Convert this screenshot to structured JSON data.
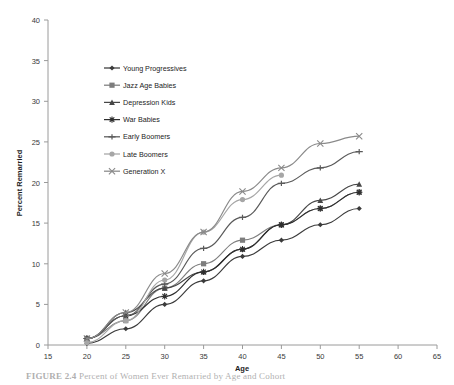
{
  "chart_data": {
    "type": "line",
    "title": "",
    "xlabel": "Age",
    "ylabel": "Percent Remarried",
    "x": [
      20,
      25,
      30,
      35,
      40,
      45,
      50,
      55
    ],
    "xlim": [
      15,
      65
    ],
    "ylim": [
      0,
      40
    ],
    "xticks": [
      15,
      20,
      25,
      30,
      35,
      40,
      45,
      50,
      55,
      60,
      65
    ],
    "yticks": [
      0,
      5,
      10,
      15,
      20,
      25,
      30,
      35,
      40
    ],
    "grid": false,
    "legend_position": "upper-left-inside",
    "series": [
      {
        "name": "Young Progressives",
        "marker": "diamond",
        "color": "#3b3b3b",
        "x": [
          20,
          25,
          30,
          35,
          40,
          45,
          50,
          55
        ],
        "values": [
          0.2,
          2.0,
          5.0,
          7.9,
          10.9,
          12.9,
          14.8,
          16.8
        ]
      },
      {
        "name": "Jazz Age Babies",
        "marker": "square",
        "color": "#7d7d7d",
        "x": [
          20,
          25,
          30,
          35,
          40,
          45,
          50,
          55
        ],
        "values": [
          0.8,
          3.0,
          7.0,
          10.0,
          12.9,
          14.8,
          16.8,
          18.8
        ]
      },
      {
        "name": "Depression Kids",
        "marker": "triangle",
        "color": "#474747",
        "x": [
          20,
          25,
          30,
          35,
          40,
          45,
          50,
          55
        ],
        "values": [
          0.8,
          4.0,
          7.0,
          9.0,
          11.8,
          14.8,
          17.8,
          19.8
        ]
      },
      {
        "name": "War Babies",
        "marker": "cross-plus",
        "color": "#2e2e2e",
        "x": [
          20,
          25,
          30,
          35,
          40,
          45,
          50,
          55
        ],
        "values": [
          0.8,
          3.6,
          6.0,
          9.0,
          11.8,
          14.8,
          16.8,
          18.8
        ]
      },
      {
        "name": "Early Boomers",
        "marker": "dash",
        "color": "#5a5a5a",
        "x": [
          20,
          25,
          30,
          35,
          40,
          45,
          50,
          55
        ],
        "values": [
          0.8,
          3.6,
          7.5,
          11.9,
          15.7,
          19.9,
          21.8,
          23.8
        ]
      },
      {
        "name": "Late Boomers",
        "marker": "circle",
        "color": "#a6a6a6",
        "x": [
          20,
          25,
          30,
          35,
          40,
          45
        ],
        "values": [
          0.3,
          3.0,
          8.0,
          13.9,
          17.9,
          20.9
        ]
      },
      {
        "name": "Generation X",
        "marker": "x-cross",
        "color": "#8a8a8a",
        "x": [
          20,
          25,
          30,
          35,
          40,
          45,
          50,
          55
        ],
        "values": [
          0.8,
          4.0,
          8.8,
          13.9,
          18.9,
          21.8,
          24.8,
          25.7
        ]
      }
    ]
  },
  "legend": {
    "entries": [
      {
        "label": "Young Progressives"
      },
      {
        "label": "Jazz Age Babies"
      },
      {
        "label": "Depression Kids"
      },
      {
        "label": "War Babies"
      },
      {
        "label": "Early Boomers"
      },
      {
        "label": "Late Boomers"
      },
      {
        "label": "Generation X"
      }
    ]
  },
  "axes": {
    "x_title": "Age",
    "y_title": "Percent Remarried",
    "x_tick_labels": [
      "15",
      "20",
      "25",
      "30",
      "35",
      "40",
      "45",
      "50",
      "55",
      "60",
      "65"
    ],
    "y_tick_labels": [
      "0",
      "5",
      "10",
      "15",
      "20",
      "25",
      "30",
      "35",
      "40"
    ]
  },
  "caption": {
    "label": "FIGURE 2.4",
    "text": "Percent of Women Ever Remarried by Age and Cohort"
  }
}
